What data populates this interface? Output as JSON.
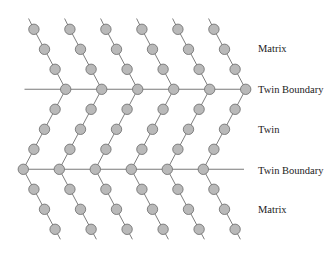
{
  "diagram": {
    "title": "",
    "regions": [
      {
        "id": "matrix-top",
        "label": "Matrix"
      },
      {
        "id": "twin-boundary-top",
        "label": "Twin Boundary"
      },
      {
        "id": "twin",
        "label": "Twin"
      },
      {
        "id": "twin-boundary-bottom",
        "label": "Twin Boundary"
      },
      {
        "id": "matrix-bottom",
        "label": "Matrix"
      }
    ],
    "atom_chains": 6,
    "atoms_per_chain_segment": {
      "matrix_top": 3,
      "twin_boundary_top": 1,
      "twin": 3,
      "twin_boundary_bottom": 1,
      "matrix_bottom": 3
    },
    "colors": {
      "atom_fill": "#b9b9b9",
      "atom_stroke": "#6a6a6a",
      "bond": "#6e6e6e",
      "text": "#222222"
    }
  }
}
